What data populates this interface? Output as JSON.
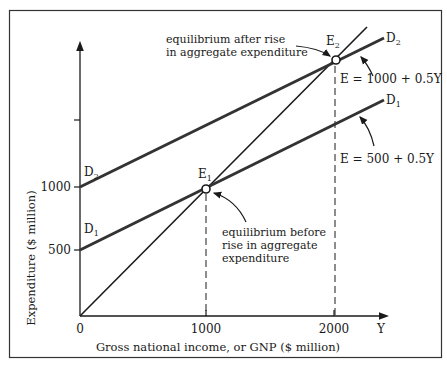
{
  "diagram": {
    "y_axis": {
      "label": "Expenditure ($ million)",
      "ticks": [
        {
          "value": 500,
          "label": "500"
        },
        {
          "value": 1000,
          "label": "1000"
        },
        {
          "value": 1500,
          "label": ""
        }
      ]
    },
    "x_axis": {
      "label": "Gross national income, or GNP ($ million)",
      "end_label": "Y",
      "ticks": [
        {
          "value": 0,
          "label": "0"
        },
        {
          "value": 1000,
          "label": "1000"
        },
        {
          "value": 2000,
          "label": "2000"
        }
      ]
    },
    "lines": {
      "d2": {
        "label": "D",
        "subscript": "2",
        "equation": "E = 1000 + 0.5Y",
        "intercept": 1000,
        "slope": 0.5
      },
      "d1": {
        "label": "D",
        "subscript": "1",
        "equation": "E = 500 + 0.5Y",
        "intercept": 500,
        "slope": 0.5
      },
      "forty_five": {
        "intercept": 0,
        "slope": 1
      }
    },
    "points": {
      "e1": {
        "label": "E",
        "subscript": "1",
        "x": 1000,
        "y": 1000
      },
      "e2": {
        "label": "E",
        "subscript": "2",
        "x": 2000,
        "y": 2000
      }
    },
    "annotations": {
      "after": {
        "line1": "equilibrium after rise",
        "line2": "in aggregate expenditure"
      },
      "before": {
        "line1": "equilibrium before",
        "line2": "rise in aggregate",
        "line3": "expenditure"
      }
    },
    "left_labels": {
      "d2": {
        "label": "D",
        "subscript": "2"
      },
      "d1": {
        "label": "D",
        "subscript": "1"
      }
    }
  }
}
